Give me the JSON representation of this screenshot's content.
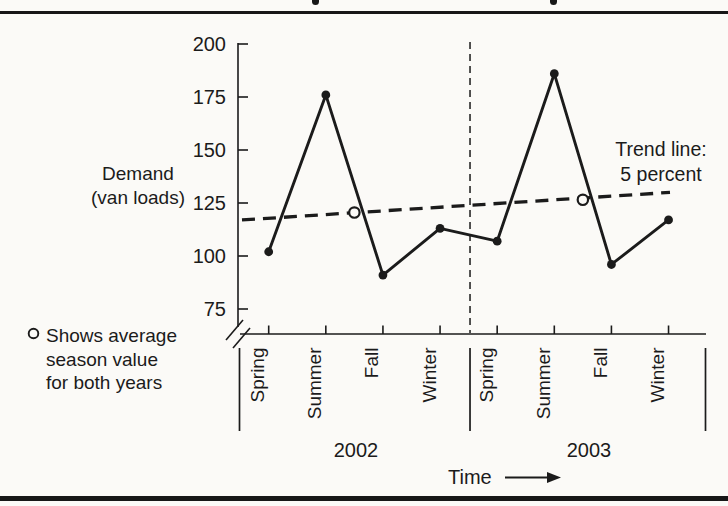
{
  "page": {
    "ink_color": "#1b1b1b",
    "background_color": "#fbfaf7",
    "cropped_title_fragments": "descenders-of-cropped-heading"
  },
  "chart_data": {
    "type": "line",
    "title": "",
    "ylabel_lines": [
      "Demand",
      "(van loads)"
    ],
    "xlabel": "Time",
    "y_ticks": [
      200,
      175,
      150,
      125,
      100,
      75
    ],
    "ylim": [
      75,
      200
    ],
    "grid": false,
    "axis_break": true,
    "categories": [
      "Spring",
      "Summer",
      "Fall",
      "Winter",
      "Spring",
      "Summer",
      "Fall",
      "Winter"
    ],
    "series": [
      {
        "name": "Demand",
        "style": "solid-line-filled-dots",
        "values": [
          102,
          176,
          91,
          113,
          107,
          186,
          96,
          117
        ]
      }
    ],
    "years": [
      {
        "label": "2002",
        "seasons": [
          "Spring",
          "Summer",
          "Fall",
          "Winter"
        ],
        "values": [
          102,
          176,
          91,
          113
        ],
        "average": 120.5
      },
      {
        "label": "2003",
        "seasons": [
          "Spring",
          "Summer",
          "Fall",
          "Winter"
        ],
        "values": [
          107,
          186,
          96,
          117
        ],
        "average": 126.5
      }
    ],
    "averages": {
      "marker": "open-circle",
      "values": [
        120.5,
        126.5
      ]
    },
    "trend": {
      "label_lines": [
        "Trend line:",
        "5 percent"
      ],
      "style": "bold-dashed",
      "start_value": 117,
      "end_value": 130
    },
    "legend": {
      "marker": "open-circle",
      "lines": [
        "Shows average",
        "season value",
        "for both years"
      ]
    },
    "separators": {
      "year_divider": "vertical-dashed-line",
      "group_brackets": "vertical-solid-lines-below-axis"
    }
  }
}
